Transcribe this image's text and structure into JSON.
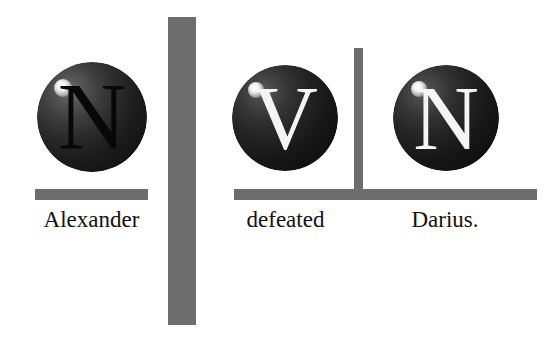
{
  "page": {
    "width": 557,
    "height": 342,
    "background_color": "#ffffff",
    "sentence": "Alexander defeated Darius."
  },
  "palette": {
    "bar_gray": "#6d6d6d",
    "sphere_dark": "#2b2b2b",
    "glyph_dark": "#080808",
    "glyph_light": "#f4f4f4",
    "caption_color": "#111111",
    "highlight": "#ffffff"
  },
  "spheres": [
    {
      "id": "sphere-n-alexander",
      "letter": "N",
      "letter_style": "dark",
      "cx": 92,
      "cy": 117,
      "r": 55,
      "highlight_cx": 63,
      "highlight_cy": 88
    },
    {
      "id": "sphere-v-defeated",
      "letter": "V",
      "letter_style": "light",
      "cx": 285,
      "cy": 118,
      "r": 53,
      "highlight_cx": 256,
      "highlight_cy": 90
    },
    {
      "id": "sphere-n-darius",
      "letter": "N",
      "letter_style": "light",
      "cx": 446,
      "cy": 118,
      "r": 53,
      "highlight_cx": 419,
      "highlight_cy": 89
    }
  ],
  "bars": {
    "vertical_thick": {
      "name": "clause-divider-thick",
      "x": 168,
      "y": 17,
      "width": 28,
      "height": 308
    },
    "vertical_thin": {
      "name": "phrase-divider-thin",
      "x": 354,
      "y": 48,
      "width": 9,
      "height": 151
    },
    "horizontal_left": {
      "name": "baseline-bar-alexander",
      "x": 35,
      "y": 189,
      "width": 113,
      "height": 11
    },
    "horizontal_right": {
      "name": "baseline-bar-predicate",
      "x": 234,
      "y": 189,
      "width": 303,
      "height": 11
    }
  },
  "captions": [
    {
      "id": "caption-alexander",
      "text": "Alexander",
      "x": 30,
      "y": 207,
      "width": 123,
      "font_size": 23
    },
    {
      "id": "caption-defeated",
      "text": "defeated",
      "x": 232,
      "y": 207,
      "width": 107,
      "font_size": 23
    },
    {
      "id": "caption-darius",
      "text": "Darius.",
      "x": 396,
      "y": 207,
      "width": 98,
      "font_size": 23
    }
  ]
}
